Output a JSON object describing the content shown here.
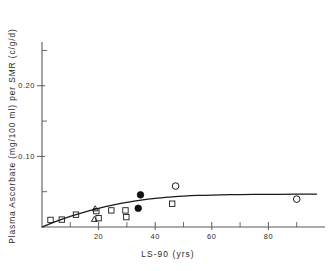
{
  "chart_data": {
    "type": "scatter",
    "title": "",
    "xlabel": "LS-90  (yrs)",
    "ylabel": "Plasma  Ascorbate  (mg/100 ml)  per  SMR  (c/g/d)",
    "xlim": [
      0,
      100
    ],
    "ylim": [
      0,
      0.262
    ],
    "grid": false,
    "legend_position": "none",
    "x_ticks_major": [
      20,
      40,
      60,
      80
    ],
    "x_ticklabels": [
      "20",
      "40",
      "60",
      "80"
    ],
    "x_ticks_minor": [
      10,
      30,
      50,
      70,
      90
    ],
    "y_ticks_major": [
      0.1,
      0.2
    ],
    "y_ticklabels": [
      "0.10",
      "0.20"
    ],
    "y_ticks_minor": [
      0.05,
      0.15,
      0.25
    ],
    "series": [
      {
        "name": "open-square",
        "marker": "open-square",
        "points": [
          {
            "x": 3.0,
            "y": 0.01
          },
          {
            "x": 7.0,
            "y": 0.0105
          },
          {
            "x": 12.0,
            "y": 0.0175
          },
          {
            "x": 19.2,
            "y": 0.0225
          },
          {
            "x": 20.0,
            "y": 0.0125
          },
          {
            "x": 24.5,
            "y": 0.0235
          },
          {
            "x": 29.5,
            "y": 0.0235
          },
          {
            "x": 29.8,
            "y": 0.014
          },
          {
            "x": 46.0,
            "y": 0.033
          }
        ]
      },
      {
        "name": "open-triangle",
        "marker": "open-triangle",
        "points": [
          {
            "x": 18.8,
            "y": 0.0265
          },
          {
            "x": 18.5,
            "y": 0.0115
          }
        ]
      },
      {
        "name": "filled-circle",
        "marker": "filled-circle",
        "points": [
          {
            "x": 34.8,
            "y": 0.0455
          },
          {
            "x": 34.0,
            "y": 0.0265
          }
        ]
      },
      {
        "name": "open-circle",
        "marker": "open-circle",
        "points": [
          {
            "x": 47.2,
            "y": 0.058
          },
          {
            "x": 90.0,
            "y": 0.0395
          }
        ]
      },
      {
        "name": "fitted-curve",
        "marker": "line",
        "points": [
          {
            "x": 0.0,
            "y": 0.0
          },
          {
            "x": 5.0,
            "y": 0.008
          },
          {
            "x": 10.0,
            "y": 0.015
          },
          {
            "x": 15.0,
            "y": 0.0212
          },
          {
            "x": 20.0,
            "y": 0.0265
          },
          {
            "x": 25.0,
            "y": 0.031
          },
          {
            "x": 30.0,
            "y": 0.0348
          },
          {
            "x": 35.0,
            "y": 0.038
          },
          {
            "x": 40.0,
            "y": 0.0405
          },
          {
            "x": 45.0,
            "y": 0.0423
          },
          {
            "x": 50.0,
            "y": 0.0437
          },
          {
            "x": 55.0,
            "y": 0.0447
          },
          {
            "x": 60.0,
            "y": 0.0453
          },
          {
            "x": 70.0,
            "y": 0.046
          },
          {
            "x": 80.0,
            "y": 0.0463
          },
          {
            "x": 90.0,
            "y": 0.0465
          },
          {
            "x": 97.0,
            "y": 0.0465
          }
        ]
      }
    ]
  },
  "colors": {
    "axis": "#5b5b5b",
    "marker": "#1a1a1a",
    "curve": "#1a1a1a",
    "text": "#2b2b2b",
    "background": "#ffffff"
  }
}
